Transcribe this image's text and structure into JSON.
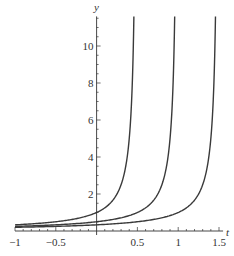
{
  "chart_data": {
    "type": "line",
    "title": "",
    "xlabel": "t",
    "ylabel": "y",
    "xlim": [
      -1,
      1.55
    ],
    "ylim": [
      0,
      11.6
    ],
    "grid": false,
    "legend": null,
    "x_ticks": [
      -1,
      -0.5,
      0.5,
      1,
      1.5
    ],
    "x_tick_labels": [
      "−1",
      "−0.5",
      "0.5",
      "1",
      "1.5"
    ],
    "y_ticks": [
      2,
      4,
      6,
      8,
      10
    ],
    "y_tick_labels": [
      "2",
      "4",
      "6",
      "8",
      "10"
    ],
    "series": [
      {
        "name": "curve-asymptote-0.5",
        "formula": "y = 0.5/(0.5 - t)",
        "asymptote": 0.5,
        "x": [
          -1,
          -0.5,
          0,
          0.25,
          0.4,
          0.45,
          0.48
        ],
        "values": [
          0.33,
          0.5,
          1.0,
          2.0,
          5.0,
          10.0,
          25.0
        ]
      },
      {
        "name": "curve-asymptote-1",
        "formula": "y = 0.5/(1 - t)",
        "asymptote": 1.0,
        "x": [
          -1,
          -0.5,
          0,
          0.5,
          0.75,
          0.9,
          0.95,
          0.98
        ],
        "values": [
          0.25,
          0.33,
          0.5,
          1.0,
          2.0,
          5.0,
          10.0,
          25.0
        ]
      },
      {
        "name": "curve-asymptote-1.5",
        "formula": "y = 0.5/(1.5 - t)",
        "asymptote": 1.5,
        "x": [
          -1,
          -0.5,
          0,
          0.5,
          1.0,
          1.25,
          1.4,
          1.45,
          1.48
        ],
        "values": [
          0.2,
          0.25,
          0.33,
          0.5,
          1.0,
          2.0,
          5.0,
          10.0,
          25.0
        ]
      }
    ],
    "style": {
      "line_color": "#3a3a3a",
      "axis_color": "#333333"
    }
  }
}
